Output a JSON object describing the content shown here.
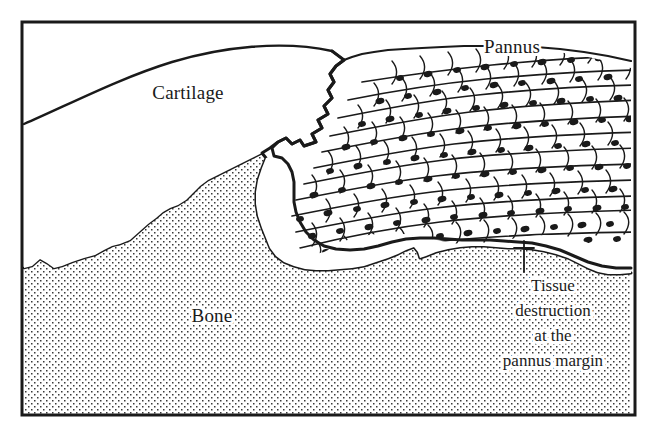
{
  "figure": {
    "kind": "medical-illustration",
    "background_color": "#ffffff",
    "ink_color": "#1a1a1a",
    "frame": {
      "name": "figure-border",
      "x": 22,
      "y": 22,
      "width": 613,
      "height": 393,
      "stroke_color": "#1a1a1a",
      "stroke_width": 3
    }
  },
  "labels": {
    "pannus": {
      "text": "Pannus",
      "x": 512,
      "y": 53,
      "anchor": "middle",
      "font_size": 19
    },
    "cartilage": {
      "text": "Cartilage",
      "x": 188,
      "y": 99,
      "anchor": "middle",
      "font_size": 19
    },
    "bone": {
      "text": "Bone",
      "x": 212,
      "y": 322,
      "anchor": "middle",
      "font_size": 19
    }
  },
  "callout": {
    "name": "tissue-destruction-callout",
    "lines": [
      "Tissue",
      "destruction",
      "at the",
      "pannus margin"
    ],
    "x": 553,
    "y_start": 291,
    "line_height": 25,
    "anchor": "middle",
    "font_size": 17,
    "leader": {
      "x": 524,
      "y_top": 241,
      "y_bottom": 272,
      "tick_y": 248,
      "tick_x1": 514,
      "tick_x2": 534
    }
  },
  "regions": {
    "cartilage": {
      "name": "cartilage-region",
      "fill": "#ffffff",
      "description": "Smooth hyaline cartilage cap, unshaded white, bounded above by a smooth convex arc and eroded on the right by pannus"
    },
    "bone": {
      "name": "bone-region",
      "fill": "stipple",
      "stipple_color": "#3a3a3a",
      "stipple_spacing": 6,
      "description": "Subchondral bone rendered as a fine regular stipple of dots, with an irregular upper contour"
    },
    "pannus": {
      "name": "pannus-region",
      "fill": "cells",
      "description": "Wedge of elongated spindle-shaped synovial cells with dark nuclei, oriented diagonally, invading from upper right",
      "cell_nucleus_color": "#1a1a1a"
    },
    "destruction_gap": {
      "name": "tissue-destruction-zone",
      "fill": "#ffffff",
      "description": "White cleft separating the advancing pannus from the eroded bone and cartilage surfaces"
    }
  }
}
